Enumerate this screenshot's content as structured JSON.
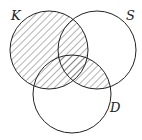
{
  "diagram": {
    "type": "venn-3",
    "sets": [
      {
        "label": "K",
        "cx": 49,
        "cy": 50,
        "r": 39,
        "label_x": 11,
        "label_y": 20
      },
      {
        "label": "S",
        "cx": 97,
        "cy": 50,
        "r": 39,
        "label_x": 126,
        "label_y": 20
      },
      {
        "label": "D",
        "cx": 72,
        "cy": 94,
        "r": 39,
        "label_x": 110,
        "label_y": 112
      }
    ],
    "shaded_region": "K ∪ (S ∩ D)",
    "colors": {
      "stroke": "#222222",
      "hatch": "#555555",
      "background": "#ffffff"
    }
  }
}
